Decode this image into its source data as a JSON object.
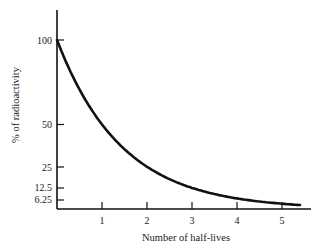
{
  "chart_data": {
    "type": "line",
    "title": "",
    "xlabel": "Number of half-lives",
    "ylabel": "% of radioactivity",
    "x": [
      0,
      1,
      2,
      3,
      4,
      5,
      5.4
    ],
    "series": [
      {
        "name": "Radioactive decay",
        "values": [
          100,
          50,
          25,
          12.5,
          6.25,
          3.125,
          2.4
        ]
      }
    ],
    "x_ticks": [
      "1",
      "2",
      "3",
      "4",
      "5"
    ],
    "y_ticks": [
      "100",
      "50",
      "25",
      "12.5",
      "6.25"
    ],
    "y_tick_values": [
      100,
      50,
      25,
      12.5,
      6.25
    ],
    "xlim": [
      0,
      5.6
    ],
    "ylim": [
      0,
      118
    ],
    "grid": false,
    "legend": "none",
    "colors": {
      "line": "#111111",
      "axis": "#111111",
      "text": "#1a1a1a"
    }
  }
}
